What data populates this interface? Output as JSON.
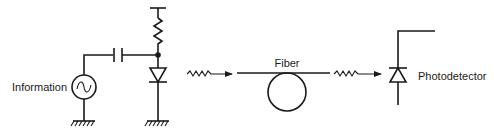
{
  "diagram": {
    "labels": {
      "source": "Information",
      "fiber": "Fiber",
      "detector": "Photodetector"
    },
    "components": [
      {
        "id": "ac-source",
        "type": "ac-voltage-source",
        "label": "Information"
      },
      {
        "id": "coupling-capacitor",
        "type": "capacitor"
      },
      {
        "id": "bias-resistor",
        "type": "resistor"
      },
      {
        "id": "light-emitting-diode",
        "type": "diode"
      },
      {
        "id": "ground-1",
        "type": "ground"
      },
      {
        "id": "ground-2",
        "type": "ground"
      },
      {
        "id": "optical-signal-in",
        "type": "wavy-arrow"
      },
      {
        "id": "optical-fiber",
        "type": "fiber-loop",
        "label": "Fiber"
      },
      {
        "id": "optical-signal-out",
        "type": "wavy-arrow"
      },
      {
        "id": "photodiode",
        "type": "photodiode",
        "label": "Photodetector"
      }
    ],
    "colors": {
      "stroke": "#1a1a1a",
      "background": "#ffffff"
    }
  }
}
